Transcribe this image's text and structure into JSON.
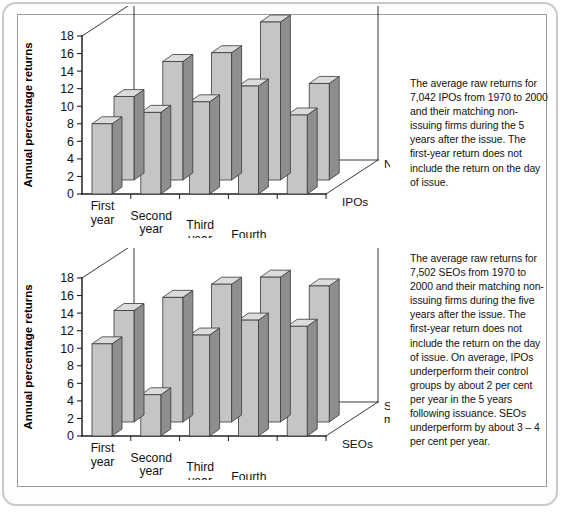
{
  "figure": {
    "y_axis_title": "Annual percentage returns",
    "y_ticks": [
      "0",
      "2",
      "4",
      "6",
      "8",
      "10",
      "12",
      "14",
      "16",
      "18"
    ],
    "x_categories": [
      "First\nyear",
      "Second\nyear",
      "Third\nyear",
      "Fourth\nyear",
      "Fifth\nyear"
    ],
    "bar_face_color": "#c5c5c5",
    "bar_side_color": "#8e8e8e",
    "bar_top_color": "#dcdcdc",
    "axis_color": "#222222"
  },
  "captions": {
    "top": "The average raw returns for 7,042 IPOs from 1970 to 2000 and their matching non-issuing firms during the 5 years after the issue. The first-year return does not include the return on the day of issue.",
    "bottom": "The average raw returns for 7,502 SEOs from 1970 to 2000 and their matching non-issuing firms during the five years after the issue. The first-year return does not include the return on the day of issue. On average, IPOs underperform their control groups by about 2 per cent per year in the 5 years following issuance. SEOs underperform by about 3 – 4 per cent per year."
  },
  "chart_data": [
    {
      "type": "bar",
      "title": "",
      "xlabel": "",
      "ylabel": "Annual percentage returns",
      "ylim": [
        0,
        18
      ],
      "yticks": [
        0,
        2,
        4,
        6,
        8,
        10,
        12,
        14,
        16,
        18
      ],
      "grid": false,
      "three_d": true,
      "legend_position": "depth-axis-right",
      "categories": [
        "First year",
        "Second year",
        "Third year",
        "Fourth year",
        "Fifth year"
      ],
      "series": [
        {
          "name": "IPOs",
          "depth_label": "IPOs",
          "values": [
            8.0,
            9.3,
            10.5,
            12.3,
            9.0
          ]
        },
        {
          "name": "Non-issuers",
          "depth_label": "Non-issuers",
          "values": [
            9.5,
            13.5,
            14.5,
            18.0,
            11.0
          ]
        }
      ]
    },
    {
      "type": "bar",
      "title": "",
      "xlabel": "",
      "ylabel": "Annual percentage returns",
      "ylim": [
        0,
        18
      ],
      "yticks": [
        0,
        2,
        4,
        6,
        8,
        10,
        12,
        14,
        16,
        18
      ],
      "grid": false,
      "three_d": true,
      "legend_position": "depth-axis-right",
      "categories": [
        "First year",
        "Second year",
        "Third year",
        "Fourth year",
        "Fifth year"
      ],
      "series": [
        {
          "name": "SEOs",
          "depth_label": "SEOs",
          "values": [
            10.5,
            4.7,
            11.5,
            13.2,
            12.5
          ]
        },
        {
          "name": "Style matched",
          "depth_label": "Style matched",
          "values": [
            12.7,
            14.2,
            15.7,
            16.5,
            15.5
          ]
        }
      ]
    }
  ]
}
